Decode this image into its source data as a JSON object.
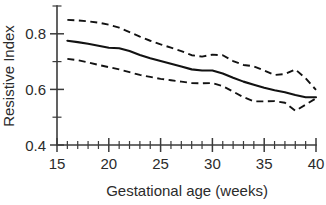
{
  "chart_data": {
    "type": "line",
    "title": "",
    "xlabel": "Gestational age (weeks)",
    "ylabel": "Resistive Index",
    "xlim": [
      15,
      40
    ],
    "ylim": [
      0.4,
      0.9
    ],
    "grid": false,
    "legend": "none",
    "xticks": [
      15,
      20,
      25,
      30,
      35,
      40
    ],
    "xtick_labels": [
      "15",
      "20",
      "25",
      "30",
      "35",
      "40"
    ],
    "xminor_step": 1,
    "yticks": [
      0.4,
      0.5,
      0.6,
      0.7,
      0.8
    ],
    "ytick_labels": [
      "0.4",
      "",
      "0.6",
      "",
      "0.8"
    ],
    "x": [
      16,
      17,
      18,
      19,
      20,
      21,
      22,
      23,
      24,
      25,
      26,
      27,
      28,
      29,
      30,
      31,
      32,
      33,
      34,
      35,
      36,
      37,
      38,
      39,
      40
    ],
    "series": [
      {
        "name": "Upper reference limit",
        "style": "dashed",
        "values": [
          0.85,
          0.848,
          0.845,
          0.84,
          0.833,
          0.822,
          0.806,
          0.79,
          0.775,
          0.762,
          0.75,
          0.738,
          0.723,
          0.718,
          0.725,
          0.723,
          0.702,
          0.688,
          0.683,
          0.668,
          0.652,
          0.655,
          0.672,
          0.64,
          0.598
        ]
      },
      {
        "name": "Median",
        "style": "solid",
        "values": [
          0.775,
          0.77,
          0.764,
          0.757,
          0.75,
          0.748,
          0.738,
          0.724,
          0.712,
          0.702,
          0.692,
          0.682,
          0.672,
          0.668,
          0.668,
          0.657,
          0.642,
          0.628,
          0.617,
          0.606,
          0.597,
          0.59,
          0.58,
          0.572,
          0.572
        ]
      },
      {
        "name": "Lower reference limit",
        "style": "dashed",
        "values": [
          0.71,
          0.705,
          0.697,
          0.688,
          0.68,
          0.672,
          0.662,
          0.652,
          0.645,
          0.638,
          0.633,
          0.628,
          0.623,
          0.622,
          0.623,
          0.612,
          0.592,
          0.572,
          0.557,
          0.557,
          0.558,
          0.552,
          0.523,
          0.545,
          0.568
        ]
      }
    ]
  }
}
